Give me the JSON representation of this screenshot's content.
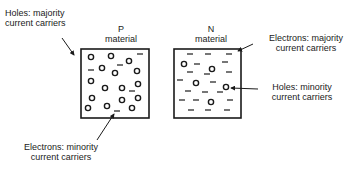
{
  "diagram": {
    "p_material": {
      "title_line1": "P",
      "title_line2": "material",
      "majority_label_line1": "Holes: majority",
      "majority_label_line2": "current carriers",
      "minority_label_line1": "Electrons: minority",
      "minority_label_line2": "current carriers",
      "box": {
        "x": 81,
        "y": 49,
        "w": 68,
        "h": 69
      },
      "holes": [
        [
          91,
          57
        ],
        [
          111,
          56
        ],
        [
          129,
          61
        ],
        [
          102,
          68
        ],
        [
          115,
          73
        ],
        [
          137,
          71
        ],
        [
          91,
          81
        ],
        [
          105,
          88
        ],
        [
          122,
          88
        ],
        [
          138,
          84
        ],
        [
          92,
          98
        ],
        [
          122,
          100
        ],
        [
          138,
          98
        ],
        [
          88,
          108
        ],
        [
          107,
          106
        ],
        [
          132,
          108
        ]
      ],
      "electrons": [
        [
          140,
          54
        ],
        [
          91,
          70
        ],
        [
          120,
          65
        ],
        [
          132,
          91
        ],
        [
          117,
          111
        ]
      ]
    },
    "n_material": {
      "title_line1": "N",
      "title_line2": "material",
      "majority_label_line1": "Electrons: majority",
      "majority_label_line2": "current carriers",
      "minority_label_line1": "Holes: minority",
      "minority_label_line2": "current carriers",
      "box": {
        "x": 174,
        "y": 49,
        "w": 67,
        "h": 69
      },
      "holes": [
        [
          184,
          64
        ],
        [
          212,
          69
        ],
        [
          196,
          83
        ],
        [
          226,
          87
        ],
        [
          211,
          102
        ]
      ],
      "electrons": [
        [
          190,
          54
        ],
        [
          208,
          54
        ],
        [
          229,
          54
        ],
        [
          197,
          64
        ],
        [
          225,
          62
        ],
        [
          190,
          72
        ],
        [
          207,
          74
        ],
        [
          229,
          72
        ],
        [
          180,
          80
        ],
        [
          213,
          82
        ],
        [
          188,
          91
        ],
        [
          205,
          92
        ],
        [
          220,
          92
        ],
        [
          182,
          100
        ],
        [
          196,
          100
        ],
        [
          230,
          100
        ],
        [
          191,
          110
        ],
        [
          208,
          110
        ],
        [
          227,
          110
        ]
      ]
    },
    "colors": {
      "ink": "#1a1a1a",
      "background": "#ffffff"
    }
  }
}
